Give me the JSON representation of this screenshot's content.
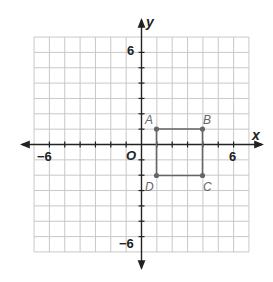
{
  "chart_data": {
    "type": "scatter",
    "title": "",
    "xlabel": "x",
    "ylabel": "y",
    "xlim": [
      -7,
      7
    ],
    "ylim": [
      -7,
      7
    ],
    "grid": true,
    "origin_label": "O",
    "x_tick_labels": [
      {
        "value": -6,
        "label": "−6"
      },
      {
        "value": 6,
        "label": "6"
      }
    ],
    "y_tick_labels": [
      {
        "value": 6,
        "label": "6"
      },
      {
        "value": -6,
        "label": "−6"
      }
    ],
    "points": [
      {
        "label": "A",
        "x": 1,
        "y": 1
      },
      {
        "label": "B",
        "x": 4,
        "y": 1
      },
      {
        "label": "C",
        "x": 4,
        "y": -2
      },
      {
        "label": "D",
        "x": 1,
        "y": -2
      }
    ],
    "polygon": [
      "A",
      "B",
      "C",
      "D"
    ],
    "colors": {
      "grid": "#c8c8c8",
      "axis": "#222222",
      "shape": "#666666"
    }
  },
  "labels": {
    "x_axis": "x",
    "y_axis": "y",
    "origin": "O",
    "x_neg6": "−6",
    "x_pos6": "6",
    "y_pos6": "6",
    "y_neg6": "−6",
    "A": "A",
    "B": "B",
    "C": "C",
    "D": "D"
  }
}
